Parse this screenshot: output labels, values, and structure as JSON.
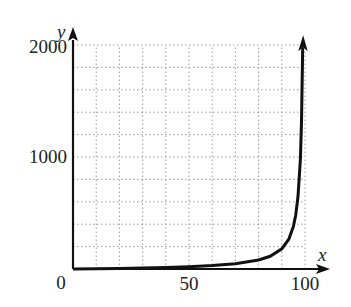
{
  "chart_data": {
    "type": "line",
    "title": "",
    "xlabel": "x",
    "ylabel": "y",
    "xlim": [
      0,
      100
    ],
    "ylim": [
      0,
      2000
    ],
    "x_ticks": [
      0,
      50,
      100
    ],
    "y_ticks": [
      0,
      1000,
      2000
    ],
    "x_tick_labels": [
      "50",
      "100"
    ],
    "y_tick_labels": [
      "0",
      "1000",
      "2000"
    ],
    "grid": true,
    "grid_style": "dotted",
    "grid_x_step": 10,
    "grid_y_step": 200,
    "legend": null,
    "vertical_asymptote": 100,
    "series": [
      {
        "name": "curve",
        "x": [
          0,
          10,
          20,
          30,
          40,
          50,
          60,
          70,
          80,
          85,
          90,
          93,
          95,
          96,
          97,
          98,
          98.5,
          99
        ],
        "values": [
          0,
          2,
          5,
          9,
          13,
          20,
          30,
          47,
          80,
          113,
          180,
          266,
          380,
          480,
          647,
          980,
          1313,
          1980
        ]
      }
    ],
    "colors": {
      "curve": "#111111",
      "axes": "#111111",
      "grid": "#9a9a9a"
    }
  }
}
